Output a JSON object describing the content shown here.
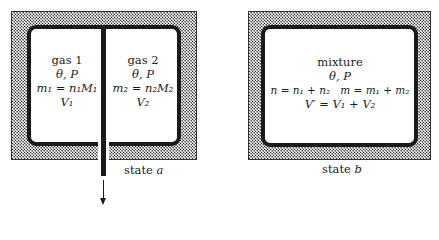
{
  "diagram": {
    "state_a": {
      "caption_prefix": "state",
      "caption_var": "a",
      "gas1": {
        "name": "gas 1",
        "conditions": "θ, P",
        "mass_relation": "m₁ = n₁M₁",
        "volume": "V₁"
      },
      "gas2": {
        "name": "gas 2",
        "conditions": "θ, P",
        "mass_relation": "m₂ = n₂M₂",
        "volume": "V₂"
      },
      "partition": "removable partition pulled out downward",
      "arrow_direction": "down"
    },
    "state_b": {
      "caption_prefix": "state",
      "caption_var": "b",
      "mixture": {
        "name": "mixture",
        "conditions": "θ, P",
        "moles_relation": "n = n₁ + n₂",
        "mass_relation": "m = m₁ + m₂",
        "volume_relation": "V′ = V₁ + V₂"
      }
    },
    "colors": {
      "wall": "#2a2a2a",
      "chamber_border": "#1a1a1a",
      "background": "#ffffff",
      "text": "#1c1c1c"
    }
  }
}
